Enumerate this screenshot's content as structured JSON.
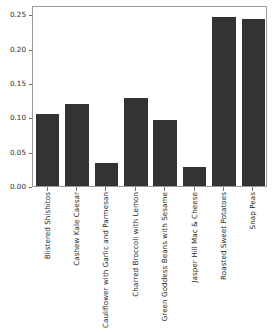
{
  "chart_data": {
    "type": "bar",
    "title": "",
    "xlabel": "",
    "ylabel": "",
    "ylim": [
      0.0,
      0.2638
    ],
    "yticks": [
      "0.00",
      "0.05",
      "0.10",
      "0.15",
      "0.20",
      "0.25"
    ],
    "ytick_values": [
      0.0,
      0.05,
      0.1,
      0.15,
      0.2,
      0.25
    ],
    "grid": false,
    "legend": null,
    "bar_color": "#333333",
    "categories": [
      "Blistered Shishitos",
      "Cashew Kale Caesar",
      "Cauliflower with Garlic and Parmesan",
      "Charred Broccoli with Lemon",
      "Green Goddess Beans with Sesame",
      "Jasper Hill Mac & Cheese",
      "Roasted Sweet Potatoes",
      "Snap Peas"
    ],
    "values": [
      0.105,
      0.119,
      0.034,
      0.128,
      0.096,
      0.027,
      0.247,
      0.244
    ]
  }
}
